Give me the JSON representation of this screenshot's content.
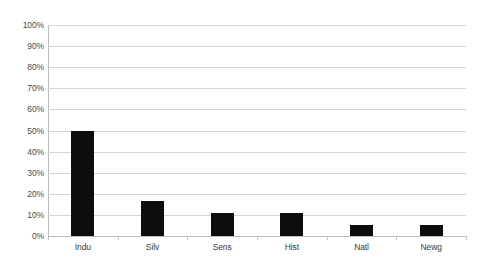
{
  "chart_data": {
    "type": "bar",
    "title": "",
    "subtitle": "",
    "xlabel": "",
    "ylabel": "",
    "categories": [
      "Indu",
      "Silv",
      "Sens",
      "Hist",
      "Natl",
      "Newg"
    ],
    "values": [
      50,
      16.5,
      11,
      11,
      5,
      5
    ],
    "value_labels": [
      "50%",
      "16.5%",
      "11%",
      "11%",
      "5%",
      "5%"
    ],
    "ylim": [
      0,
      100
    ],
    "ytick_values": [
      100,
      90,
      80,
      70,
      60,
      50,
      40,
      30,
      20,
      10,
      0
    ],
    "ytick_labels": [
      "100%",
      "90%",
      "80%",
      "70%",
      "60%",
      "50%",
      "40%",
      "30%",
      "20%",
      "10%",
      "0%"
    ],
    "grid": true,
    "legend": false,
    "legend_position": "none",
    "series": [
      {
        "name": "",
        "values": [
          50,
          16.5,
          11,
          11,
          5,
          5
        ]
      }
    ],
    "colors": {
      "bar": "#0d0d0d",
      "gridline": "#d6d6d6",
      "axis": "#bdbdbd",
      "background": "#ffffff",
      "tick_text": "#4a4a4a"
    }
  }
}
